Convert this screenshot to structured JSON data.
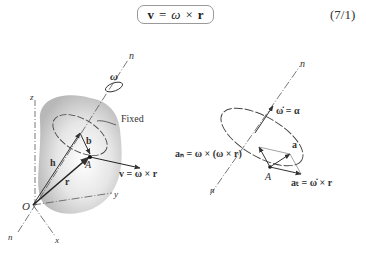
{
  "equation": {
    "lhs": "v",
    "equals": "=",
    "omega": "ω",
    "cross": "×",
    "rhs": "r",
    "number": "(7/1)"
  },
  "figure_left": {
    "labels": {
      "n_top": "n",
      "omega": "ω",
      "z": "z",
      "fixed_axis_1": "Fixed",
      "fixed_axis_2": "axis",
      "b": "b",
      "h": "h",
      "A": "A",
      "velocity": "v = ω × r",
      "r": "r",
      "O": "O",
      "y": "y",
      "n_bottom": "n",
      "x": "x"
    }
  },
  "figure_right": {
    "labels": {
      "n_top": "n",
      "alpha": "ω̇ = α",
      "a": "a",
      "an": "aₙ = ω × (ω × r)",
      "A": "A",
      "at": "aₜ = ω̇ × r",
      "n_bottom": "n"
    }
  }
}
